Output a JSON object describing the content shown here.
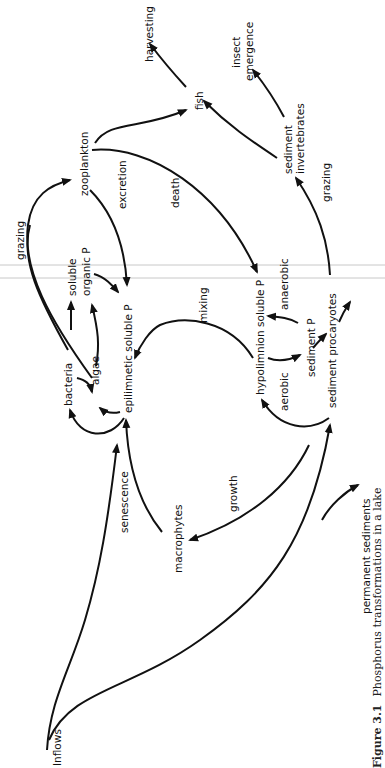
{
  "figure": {
    "number": "Figure 3.1",
    "caption": "Phosphorus transformations in a lake",
    "orientation": "rotated 90° counter-clockwise"
  },
  "nodes": {
    "inflows": "Inflows",
    "macrophytes": "macrophytes",
    "epilimnetic": "epilimnetic  soluble  P",
    "bacteria": "bacteria",
    "algae": "algae",
    "soluble_organic_1": "soluble",
    "soluble_organic_2": "organic  P",
    "zooplankton": "zooplankton",
    "fish": "fish",
    "harvesting": "harvesting",
    "insect_1": "insect",
    "insect_2": "emergence",
    "sed_invert_1": "sediment",
    "sed_invert_2": "invertebrates",
    "hypolimnion": "hypolimnion  soluble  P",
    "sediment_p": "sediment  P",
    "sed_procaryotes": "sediment  procaryotes",
    "permanent": "permanent  sediments"
  },
  "edge_labels": {
    "grazing_top": "grazing",
    "excretion": "excretion",
    "death": "death",
    "grazing_right": "grazing",
    "mixing": "mixing",
    "anaerobic": "anaerobic",
    "aerobic": "aerobic",
    "senescence": "senescence",
    "growth": "growth"
  },
  "edges": [
    {
      "from": "Inflows",
      "to": "epilimnetic soluble P"
    },
    {
      "from": "Inflows",
      "to": "sediment procaryotes"
    },
    {
      "from": "macrophytes",
      "to": "epilimnetic soluble P",
      "label": "senescence"
    },
    {
      "from": "sediment",
      "to": "macrophytes",
      "label": "growth"
    },
    {
      "from": "epilimnetic soluble P",
      "to": "bacteria"
    },
    {
      "from": "epilimnetic soluble P",
      "to": "algae"
    },
    {
      "from": "bacteria",
      "to": "algae"
    },
    {
      "from": "bacteria",
      "to": "soluble organic P"
    },
    {
      "from": "algae",
      "to": "soluble organic P"
    },
    {
      "from": "soluble organic P",
      "to": "epilimnetic soluble P"
    },
    {
      "from": "algae",
      "to": "zooplankton",
      "label": "grazing"
    },
    {
      "from": "zooplankton",
      "to": "epilimnetic soluble P",
      "label": "excretion"
    },
    {
      "from": "zooplankton",
      "to": "hypolimnion soluble P",
      "label": "death"
    },
    {
      "from": "zooplankton",
      "to": "fish"
    },
    {
      "from": "fish",
      "to": "harvesting"
    },
    {
      "from": "sediment procaryotes",
      "to": "sediment invertebrates",
      "label": "grazing"
    },
    {
      "from": "sediment invertebrates",
      "to": "fish"
    },
    {
      "from": "sediment invertebrates",
      "to": "insect emergence"
    },
    {
      "from": "hypolimnion soluble P",
      "to": "epilimnetic soluble P",
      "label": "mixing"
    },
    {
      "from": "hypolimnion soluble P",
      "to": "sediment P",
      "label": "aerobic"
    },
    {
      "from": "sediment P",
      "to": "hypolimnion soluble P",
      "label": "anaerobic"
    },
    {
      "from": "sediment P",
      "to": "sediment procaryotes"
    },
    {
      "from": "sediment procaryotes",
      "to": "hypolimnion soluble P"
    },
    {
      "from": "sediment",
      "to": "permanent sediments"
    }
  ]
}
